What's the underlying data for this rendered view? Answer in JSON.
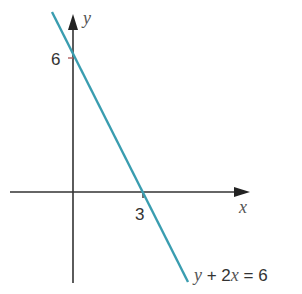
{
  "diagram": {
    "axes": {
      "x_label": "x",
      "y_label": "y"
    },
    "intercepts": {
      "y_intercept_label": "6",
      "x_intercept_label": "3"
    },
    "line": {
      "equation_var1": "y",
      "equation_rest": " + 2",
      "equation_var2": "x",
      "equation_end": " = 6",
      "color": "#3a9db0"
    },
    "axis_color": "#333333"
  }
}
